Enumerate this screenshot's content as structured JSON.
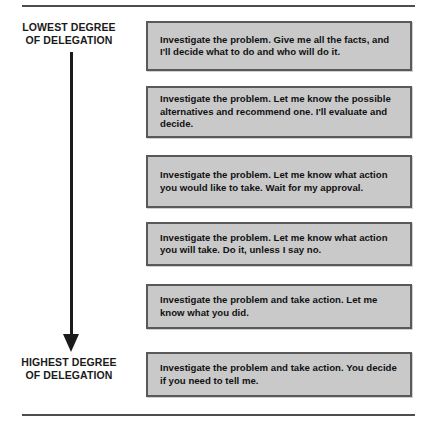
{
  "diagram": {
    "title_hidden": "",
    "axis": {
      "top_label_line1": "LOWEST DEGREE",
      "top_label_line2": "OF DELEGATION",
      "bottom_label_line1": "HIGHEST DEGREE",
      "bottom_label_line2": "OF DELEGATION",
      "arrow_direction": "downward",
      "arrow_icon": "down-arrow-icon"
    },
    "colors": {
      "box_fill": "#c9c9c9",
      "box_border": "#595959",
      "text": "#111111",
      "rule": "#4d4d4d",
      "arrow": "#1a1a1a"
    },
    "levels": [
      {
        "index": 1,
        "text": "Investigate the problem. Give me all the facts, and I'll decide what to do and who will do it."
      },
      {
        "index": 2,
        "text": "Investigate the problem. Let me know the possible alternatives and recommend one. I'll evaluate and decide."
      },
      {
        "index": 3,
        "text": "Investigate the problem. Let me know what action you would like to take. Wait for my approval."
      },
      {
        "index": 4,
        "text": "Investigate the problem. Let me know what action you will take. Do it, unless I say no."
      },
      {
        "index": 5,
        "text": "Investigate the problem and take action. Let me know what you did."
      },
      {
        "index": 6,
        "text": "Investigate the problem and take action. You decide if you need to tell me."
      }
    ]
  }
}
